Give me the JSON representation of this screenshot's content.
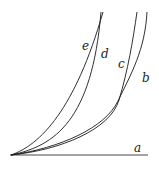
{
  "diagram": {
    "labels": {
      "a": "a",
      "b": "b",
      "c": "c",
      "d": "d",
      "e": "e"
    },
    "colors": {
      "stroke": "#1a1a1a",
      "background": "#ffffff"
    }
  }
}
